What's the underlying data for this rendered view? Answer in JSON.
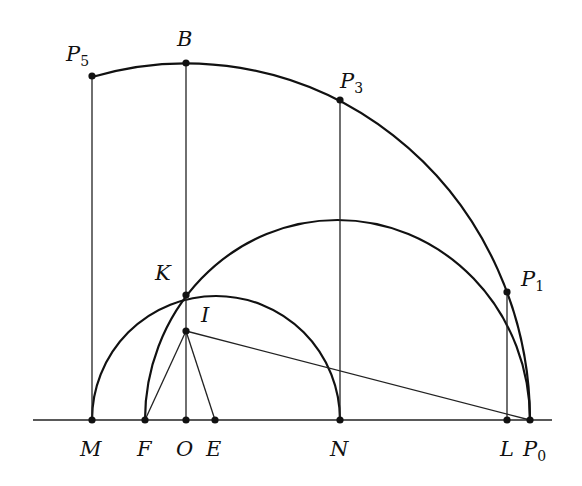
{
  "diagram": {
    "type": "geometric construction",
    "colors": {
      "stroke": "#111111",
      "background": "#ffffff"
    },
    "baseline": {
      "y": 420,
      "x1": 33,
      "x2": 552
    },
    "points": [
      {
        "id": "M",
        "label": "M",
        "sub": "",
        "x": 92,
        "y": 420,
        "lx": 80,
        "ly": 456
      },
      {
        "id": "F",
        "label": "F",
        "sub": "",
        "x": 145,
        "y": 420,
        "lx": 136,
        "ly": 456
      },
      {
        "id": "O",
        "label": "O",
        "sub": "",
        "x": 186,
        "y": 420,
        "lx": 175,
        "ly": 456
      },
      {
        "id": "E",
        "label": "E",
        "sub": "",
        "x": 215,
        "y": 420,
        "lx": 206,
        "ly": 456
      },
      {
        "id": "N",
        "label": "N",
        "sub": "",
        "x": 340,
        "y": 420,
        "lx": 330,
        "ly": 456
      },
      {
        "id": "L",
        "label": "L",
        "sub": "",
        "x": 507,
        "y": 420,
        "lx": 499,
        "ly": 456
      },
      {
        "id": "P0",
        "label": "P",
        "sub": "0",
        "x": 530,
        "y": 420,
        "lx": 524,
        "ly": 456
      },
      {
        "id": "I",
        "label": "I",
        "sub": "",
        "x": 186,
        "y": 331,
        "lx": 200,
        "ly": 322
      },
      {
        "id": "K",
        "label": "K",
        "sub": "",
        "x": 186,
        "y": 295,
        "lx": 156,
        "ly": 279
      },
      {
        "id": "P1",
        "label": "P",
        "sub": "1",
        "x": 507,
        "y": 292,
        "lx": 522,
        "ly": 285
      },
      {
        "id": "P3",
        "label": "P",
        "sub": "3",
        "x": 340,
        "y": 100,
        "lx": 340,
        "ly": 88
      },
      {
        "id": "B",
        "label": "B",
        "sub": "",
        "x": 186,
        "y": 63,
        "lx": 177,
        "ly": 46
      },
      {
        "id": "P5",
        "label": "P",
        "sub": "5",
        "x": 92,
        "y": 76,
        "lx": 58,
        "ly": 60
      }
    ],
    "segments": [
      {
        "from": "M",
        "to": "P5"
      },
      {
        "from": "O",
        "to": "B"
      },
      {
        "from": "N",
        "to": "P3"
      },
      {
        "from": "L",
        "to": "P1"
      },
      {
        "from": "I",
        "to": "F"
      },
      {
        "from": "I",
        "to": "E"
      },
      {
        "from": "I",
        "to": "P0"
      }
    ],
    "arcs": [
      {
        "name": "outer-quarter-ellipse",
        "from": "P5",
        "through": [
          "B",
          "P3",
          "P1"
        ],
        "to": "P0",
        "cx": 186,
        "cy": 420,
        "rx": 344,
        "ry": 357
      },
      {
        "name": "middle-semicircle",
        "from": "F",
        "through": [
          "K"
        ],
        "to": "P0",
        "cx": 337.5,
        "cy": 420,
        "rx": 192.5,
        "ry": 200
      },
      {
        "name": "small-semicircle",
        "from": "M",
        "through": [
          "K"
        ],
        "to": "N",
        "cx": 216,
        "cy": 420,
        "rx": 124,
        "ry": 124
      }
    ]
  },
  "labels": {
    "M": "M",
    "F": "F",
    "O": "O",
    "E": "E",
    "N": "N",
    "L": "L",
    "P": "P",
    "I": "I",
    "K": "K",
    "B": "B",
    "sub0": "0",
    "sub1": "1",
    "sub3": "3",
    "sub5": "5"
  }
}
